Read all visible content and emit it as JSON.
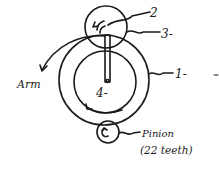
{
  "diagram": {
    "type": "epicyclic-gear-train-sketch",
    "colors": {
      "ink": "#1a1a1a",
      "background": "#ffffff"
    },
    "labels": {
      "gear_2": "2",
      "gear_3": "3-",
      "gear_1": "1-",
      "gear_4": "4-",
      "arm": "Arm",
      "pinion": "Pinion",
      "pinion_teeth": "(22 teeth)"
    },
    "components": [
      {
        "id": "gear-1",
        "label": "1-",
        "kind": "annulus-outer-circle"
      },
      {
        "id": "gear-4",
        "label": "4-",
        "kind": "inner-gear-circle"
      },
      {
        "id": "gear-3",
        "label": "3-",
        "kind": "planet-gear-circle"
      },
      {
        "id": "gear-2",
        "label": "2",
        "kind": "planet-inner-gear"
      },
      {
        "id": "arm",
        "label": "Arm",
        "kind": "rotating-arm"
      },
      {
        "id": "pinion",
        "label": "Pinion",
        "teeth": 22,
        "kind": "driving-pinion"
      }
    ]
  }
}
